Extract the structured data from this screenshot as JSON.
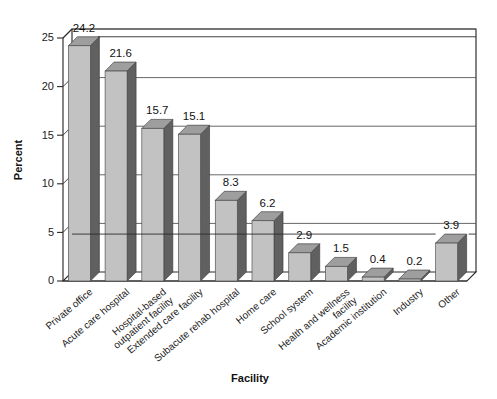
{
  "chart_data": {
    "type": "bar",
    "title": "",
    "subtitle": "",
    "xlabel": "Facility",
    "ylabel": "Percent",
    "ylim": [
      0,
      25
    ],
    "ytick_step": 5,
    "yticks": [
      "0",
      "5",
      "10",
      "15",
      "20",
      "25"
    ],
    "grid": "horizontal",
    "legend": "none",
    "style_3d": true,
    "categories": [
      "Private office",
      "Acute care hospital",
      "Hospital-based outpatient facility",
      "Extended care facility",
      "Subacute rehab hospital",
      "Home care",
      "School system",
      "Health and wellness facility",
      "Academic institution",
      "Industry",
      "Other"
    ],
    "category_lines": [
      [
        "Private office"
      ],
      [
        "Acute care hospital"
      ],
      [
        "Hospital-based",
        "outpatient facility"
      ],
      [
        "Extended care facility"
      ],
      [
        "Subacute rehab hospital"
      ],
      [
        "Home care"
      ],
      [
        "School system"
      ],
      [
        "Health and wellness",
        "facility"
      ],
      [
        "Academic institution"
      ],
      [
        "Industry"
      ],
      [
        "Other"
      ]
    ],
    "values": [
      24.2,
      21.6,
      15.7,
      15.1,
      8.3,
      6.2,
      2.9,
      1.5,
      0.4,
      0.2,
      3.9
    ],
    "value_labels": [
      "24.2",
      "21.6",
      "15.7",
      "15.1",
      "8.3",
      "6.2",
      "2.9",
      "1.5",
      "0.4",
      "0.2",
      "3.9"
    ],
    "colors": {
      "bar_front": "#c2c2c2",
      "bar_side": "#606060",
      "bar_top": "#9e9e9e",
      "axis": "#2a2a2a",
      "grid": "#4b4b4b",
      "background": "#ffffff",
      "text": "#1a1a1a"
    }
  }
}
